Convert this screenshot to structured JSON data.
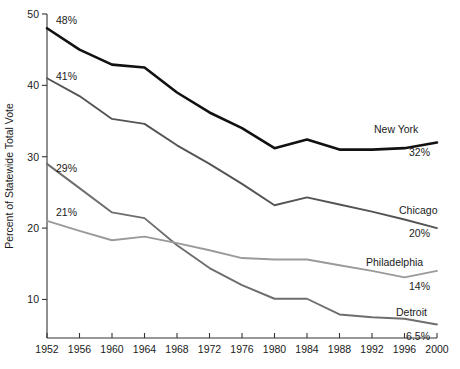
{
  "chart_data": {
    "type": "line",
    "title": "",
    "xlabel": "",
    "ylabel": "Percent of Statewide Total Vote",
    "xlim": [
      1952,
      2000
    ],
    "ylim": [
      5,
      50
    ],
    "grid": false,
    "legend": "inline-right",
    "x": [
      1952,
      1956,
      1960,
      1964,
      1968,
      1972,
      1976,
      1980,
      1984,
      1988,
      1992,
      1996,
      2000
    ],
    "xticklabels": [
      "1952",
      "1956",
      "1960",
      "1964",
      "1968",
      "1972",
      "1976",
      "1980",
      "1984",
      "1988",
      "1992",
      "1996",
      "2000"
    ],
    "yticks": [
      10,
      20,
      30,
      40,
      50
    ],
    "yticklabels": [
      "10",
      "20",
      "30",
      "40",
      "50"
    ],
    "series": [
      {
        "name": "New York",
        "color": "#111111",
        "width": 2.6,
        "values": [
          48.0,
          45.0,
          42.9,
          42.5,
          39.0,
          36.2,
          34.0,
          31.2,
          32.4,
          31.0,
          31.0,
          31.2,
          32.0
        ],
        "start_label": "48%",
        "end_label": "32%"
      },
      {
        "name": "Chicago",
        "color": "#545454",
        "width": 1.9,
        "values": [
          41.0,
          38.5,
          35.3,
          34.6,
          31.6,
          29.0,
          26.2,
          23.2,
          24.3,
          23.3,
          22.3,
          21.2,
          20.0
        ],
        "start_label": "41%",
        "end_label": "20%"
      },
      {
        "name": "Detroit",
        "color": "#6e6e6e",
        "width": 1.9,
        "values": [
          29.0,
          25.6,
          22.2,
          21.4,
          17.6,
          14.4,
          12.0,
          10.1,
          10.1,
          7.9,
          7.5,
          7.3,
          6.5
        ],
        "start_label": "29%",
        "end_label": "6.5%"
      },
      {
        "name": "Philadelphia",
        "color": "#9a9a9a",
        "width": 1.9,
        "values": [
          21.0,
          19.6,
          18.3,
          18.8,
          17.9,
          16.9,
          15.8,
          15.6,
          15.6,
          14.8,
          14.0,
          13.1,
          14.0
        ],
        "start_label": "21%",
        "end_label": "14%"
      }
    ]
  }
}
